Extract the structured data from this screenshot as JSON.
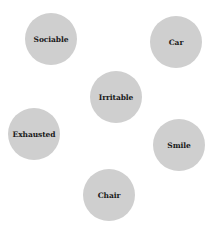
{
  "diagram": {
    "type": "word-bubbles",
    "node_color": "#cfcfcf",
    "nodes": [
      {
        "label": "Sociable",
        "cx": 51,
        "cy": 39
      },
      {
        "label": "Car",
        "cx": 176,
        "cy": 42
      },
      {
        "label": "Irritable",
        "cx": 116,
        "cy": 97
      },
      {
        "label": "Exhausted",
        "cx": 34,
        "cy": 134
      },
      {
        "label": "Smile",
        "cx": 179,
        "cy": 145
      },
      {
        "label": "Chair",
        "cx": 109,
        "cy": 195
      }
    ]
  }
}
